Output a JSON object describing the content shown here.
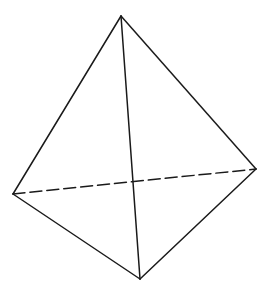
{
  "diagram": {
    "type": "tetrahedron",
    "background": "#ffffff",
    "stroke_color": "#1a1a1a",
    "stroke_width": 1.5,
    "dash_pattern": "12 5",
    "vertices": {
      "top": {
        "x": 121,
        "y": 16
      },
      "left": {
        "x": 13,
        "y": 194
      },
      "right": {
        "x": 256,
        "y": 169
      },
      "bottom": {
        "x": 140,
        "y": 279
      }
    },
    "edges": [
      {
        "from": "top",
        "to": "left",
        "style": "solid"
      },
      {
        "from": "top",
        "to": "right",
        "style": "solid"
      },
      {
        "from": "top",
        "to": "bottom",
        "style": "solid"
      },
      {
        "from": "left",
        "to": "bottom",
        "style": "solid"
      },
      {
        "from": "right",
        "to": "bottom",
        "style": "solid"
      },
      {
        "from": "left",
        "to": "right",
        "style": "dashed"
      }
    ]
  }
}
